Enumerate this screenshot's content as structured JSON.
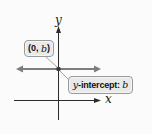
{
  "diagram": {
    "type": "coordinate-plane",
    "axes": {
      "x_label": "x",
      "y_label": "y"
    },
    "line": {
      "description": "horizontal line y = b",
      "color": "#7d7d7d"
    },
    "point": {
      "label_open": "(",
      "label_x": "0",
      "label_sep": ", ",
      "label_y": "b",
      "label_close": ")"
    },
    "intercept_callout": {
      "var": "y",
      "text": "-intercept: ",
      "value": "b"
    },
    "colors": {
      "axis": "#2b2b2b",
      "line": "#7d7d7d",
      "callout_fill": "#e9e9e9",
      "callout_border": "#9a9a9a"
    }
  }
}
